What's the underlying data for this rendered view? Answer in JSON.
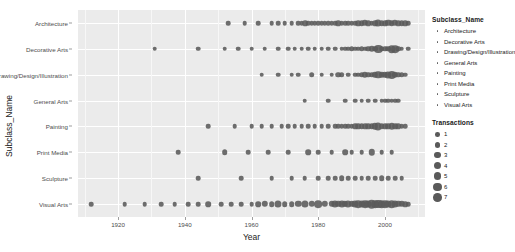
{
  "chart_data": {
    "type": "scatter",
    "title": "",
    "xlabel": "Year",
    "ylabel": "Subclass_Name",
    "xlim": [
      1908,
      2012
    ],
    "xticks": [
      1920,
      1940,
      1960,
      1980,
      2000
    ],
    "xtick_labels": [
      "1920",
      "1940",
      "1960",
      "1980",
      "2000"
    ],
    "grid": true,
    "legend_position": "right",
    "size_legend_title": "Transactions",
    "size_legend_values": [
      1,
      2,
      3,
      4,
      5,
      6,
      7
    ],
    "color_legend_title": "Subclass_Name",
    "categories": [
      "Architecture",
      "Decorative Arts",
      "Drawing/Design/Illustration",
      "General Arts",
      "Painting",
      "Print Media",
      "Sculpture",
      "Visual Arts"
    ],
    "point_color": "#5a5a5a",
    "panel_background": "#ebebeb",
    "gridline_color": "#ffffff",
    "series": [
      {
        "name": "Architecture",
        "points": [
          [
            1953,
            1
          ],
          [
            1958,
            1
          ],
          [
            1962,
            1
          ],
          [
            1966,
            1
          ],
          [
            1968,
            1
          ],
          [
            1970,
            1
          ],
          [
            1972,
            1
          ],
          [
            1974,
            1
          ],
          [
            1975,
            1
          ],
          [
            1976,
            2
          ],
          [
            1977,
            1
          ],
          [
            1978,
            1
          ],
          [
            1979,
            1
          ],
          [
            1980,
            1
          ],
          [
            1981,
            1
          ],
          [
            1982,
            1
          ],
          [
            1983,
            1
          ],
          [
            1984,
            1
          ],
          [
            1985,
            1
          ],
          [
            1986,
            2
          ],
          [
            1987,
            1
          ],
          [
            1988,
            1
          ],
          [
            1989,
            1
          ],
          [
            1990,
            1
          ],
          [
            1991,
            1
          ],
          [
            1992,
            2
          ],
          [
            1993,
            2
          ],
          [
            1994,
            3
          ],
          [
            1995,
            2
          ],
          [
            1996,
            1
          ],
          [
            1997,
            2
          ],
          [
            1998,
            4
          ],
          [
            1999,
            2
          ],
          [
            2000,
            2
          ],
          [
            2001,
            3
          ],
          [
            2002,
            2
          ],
          [
            2003,
            3
          ],
          [
            2004,
            2
          ],
          [
            2005,
            2
          ],
          [
            2006,
            2
          ],
          [
            2007,
            1
          ]
        ]
      },
      {
        "name": "Decorative Arts",
        "points": [
          [
            1931,
            1
          ],
          [
            1944,
            1
          ],
          [
            1952,
            1
          ],
          [
            1956,
            1
          ],
          [
            1960,
            1
          ],
          [
            1964,
            1
          ],
          [
            1968,
            1
          ],
          [
            1971,
            1
          ],
          [
            1973,
            1
          ],
          [
            1975,
            1
          ],
          [
            1977,
            1
          ],
          [
            1979,
            1
          ],
          [
            1981,
            1
          ],
          [
            1983,
            1
          ],
          [
            1985,
            1
          ],
          [
            1987,
            1
          ],
          [
            1988,
            1
          ],
          [
            1989,
            1
          ],
          [
            1990,
            2
          ],
          [
            1991,
            1
          ],
          [
            1992,
            1
          ],
          [
            1993,
            2
          ],
          [
            1994,
            1
          ],
          [
            1995,
            2
          ],
          [
            1996,
            3
          ],
          [
            1997,
            2
          ],
          [
            1998,
            6
          ],
          [
            1999,
            2
          ],
          [
            2000,
            2
          ],
          [
            2001,
            2
          ],
          [
            2002,
            5
          ],
          [
            2003,
            5
          ],
          [
            2004,
            2
          ],
          [
            2005,
            1
          ],
          [
            2007,
            1
          ]
        ]
      },
      {
        "name": "Drawing/Design/Illustration",
        "points": [
          [
            1963,
            1
          ],
          [
            1968,
            1
          ],
          [
            1972,
            1
          ],
          [
            1974,
            1
          ],
          [
            1978,
            2
          ],
          [
            1981,
            1
          ],
          [
            1984,
            1
          ],
          [
            1986,
            2
          ],
          [
            1987,
            2
          ],
          [
            1989,
            1
          ],
          [
            1991,
            1
          ],
          [
            1992,
            1
          ],
          [
            1993,
            2
          ],
          [
            1994,
            3
          ],
          [
            1995,
            2
          ],
          [
            1996,
            2
          ],
          [
            1997,
            3
          ],
          [
            1998,
            5
          ],
          [
            1999,
            3
          ],
          [
            2000,
            3
          ],
          [
            2001,
            4
          ],
          [
            2002,
            6
          ],
          [
            2003,
            3
          ],
          [
            2004,
            2
          ],
          [
            2005,
            2
          ],
          [
            2006,
            1
          ]
        ]
      },
      {
        "name": "General Arts",
        "points": [
          [
            1976,
            1
          ],
          [
            1983,
            1
          ],
          [
            1988,
            1
          ],
          [
            1991,
            1
          ],
          [
            1993,
            1
          ],
          [
            1995,
            1
          ],
          [
            1997,
            1
          ],
          [
            1999,
            1
          ],
          [
            2000,
            1
          ],
          [
            2001,
            1
          ],
          [
            2002,
            1
          ],
          [
            2003,
            1
          ],
          [
            2004,
            1
          ]
        ]
      },
      {
        "name": "Painting",
        "points": [
          [
            1947,
            1
          ],
          [
            1955,
            1
          ],
          [
            1960,
            1
          ],
          [
            1963,
            1
          ],
          [
            1966,
            1
          ],
          [
            1969,
            1
          ],
          [
            1971,
            1
          ],
          [
            1973,
            1
          ],
          [
            1975,
            1
          ],
          [
            1977,
            1
          ],
          [
            1979,
            1
          ],
          [
            1981,
            1
          ],
          [
            1983,
            1
          ],
          [
            1985,
            1
          ],
          [
            1986,
            1
          ],
          [
            1987,
            1
          ],
          [
            1988,
            1
          ],
          [
            1989,
            1
          ],
          [
            1990,
            1
          ],
          [
            1991,
            2
          ],
          [
            1992,
            2
          ],
          [
            1993,
            2
          ],
          [
            1994,
            2
          ],
          [
            1995,
            2
          ],
          [
            1996,
            2
          ],
          [
            1997,
            3
          ],
          [
            1998,
            4
          ],
          [
            1999,
            2
          ],
          [
            2000,
            2
          ],
          [
            2001,
            2
          ],
          [
            2002,
            3
          ],
          [
            2003,
            2
          ],
          [
            2004,
            2
          ],
          [
            2005,
            1
          ],
          [
            2006,
            1
          ]
        ]
      },
      {
        "name": "Print Media",
        "points": [
          [
            1938,
            1
          ],
          [
            1952,
            2
          ],
          [
            1959,
            1
          ],
          [
            1965,
            1
          ],
          [
            1971,
            1
          ],
          [
            1977,
            2
          ],
          [
            1980,
            1
          ],
          [
            1984,
            1
          ],
          [
            1988,
            2
          ],
          [
            1990,
            1
          ],
          [
            1993,
            1
          ],
          [
            1996,
            3
          ],
          [
            1999,
            1
          ],
          [
            2002,
            1
          ]
        ]
      },
      {
        "name": "Sculpture",
        "points": [
          [
            1944,
            1
          ],
          [
            1957,
            1
          ],
          [
            1966,
            1
          ],
          [
            1972,
            1
          ],
          [
            1976,
            1
          ],
          [
            1980,
            1
          ],
          [
            1983,
            1
          ],
          [
            1985,
            1
          ],
          [
            1987,
            2
          ],
          [
            1989,
            1
          ],
          [
            1991,
            1
          ],
          [
            1993,
            1
          ],
          [
            1995,
            1
          ],
          [
            1997,
            1
          ],
          [
            1999,
            2
          ],
          [
            2001,
            1
          ],
          [
            2003,
            1
          ],
          [
            2005,
            1
          ]
        ]
      },
      {
        "name": "Visual Arts",
        "points": [
          [
            1912,
            1
          ],
          [
            1922,
            1
          ],
          [
            1928,
            1
          ],
          [
            1933,
            1
          ],
          [
            1937,
            1
          ],
          [
            1941,
            1
          ],
          [
            1944,
            1
          ],
          [
            1947,
            2
          ],
          [
            1951,
            1
          ],
          [
            1954,
            1
          ],
          [
            1957,
            1
          ],
          [
            1960,
            1
          ],
          [
            1962,
            2
          ],
          [
            1964,
            3
          ],
          [
            1966,
            2
          ],
          [
            1968,
            4
          ],
          [
            1970,
            2
          ],
          [
            1972,
            2
          ],
          [
            1974,
            3
          ],
          [
            1976,
            4
          ],
          [
            1978,
            3
          ],
          [
            1980,
            5
          ],
          [
            1982,
            3
          ],
          [
            1984,
            3
          ],
          [
            1985,
            4
          ],
          [
            1986,
            3
          ],
          [
            1987,
            4
          ],
          [
            1988,
            3
          ],
          [
            1989,
            4
          ],
          [
            1990,
            3
          ],
          [
            1991,
            4
          ],
          [
            1992,
            5
          ],
          [
            1993,
            4
          ],
          [
            1994,
            5
          ],
          [
            1995,
            4
          ],
          [
            1996,
            7
          ],
          [
            1997,
            5
          ],
          [
            1998,
            6
          ],
          [
            1999,
            5
          ],
          [
            2000,
            5
          ],
          [
            2001,
            4
          ],
          [
            2002,
            5
          ],
          [
            2003,
            4
          ],
          [
            2004,
            3
          ],
          [
            2005,
            3
          ],
          [
            2006,
            2
          ],
          [
            2007,
            1
          ]
        ]
      }
    ]
  }
}
